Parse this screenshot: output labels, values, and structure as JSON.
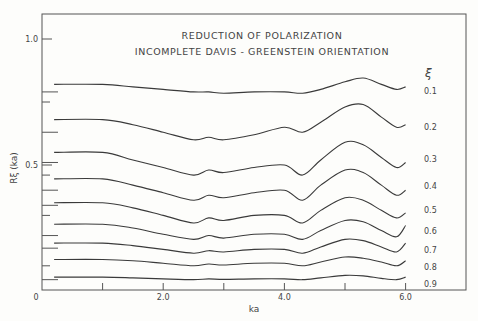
{
  "chart_data": {
    "type": "line",
    "title": "REDUCTION OF POLARIZATION",
    "subtitle": "INCOMPLETE DAVIS - GREENSTEIN ORIENTATION",
    "xlabel": "ka",
    "ylabel": "Rξ (ka)",
    "xlim": [
      0,
      7.0
    ],
    "ylim": [
      0,
      1.2
    ],
    "grid": false,
    "legend_title": "ξ",
    "legend_position": "right, inline labels at curve ends",
    "x_ticks": [
      0,
      1.0,
      2.0,
      3.0,
      4.0,
      5.0,
      6.0
    ],
    "x_tick_labels": [
      "0",
      "2.0",
      "4.0",
      "6.0"
    ],
    "y_tick_labels": [
      "1.0",
      "0.5"
    ],
    "x": [
      0.2,
      1.0,
      1.5,
      2.0,
      2.5,
      2.75,
      3.0,
      3.5,
      4.0,
      4.3,
      4.6,
      5.0,
      5.3,
      5.6,
      5.85,
      6.0
    ],
    "series": [
      {
        "name": "0.1",
        "values": [
          0.82,
          0.82,
          0.81,
          0.8,
          0.79,
          0.79,
          0.785,
          0.79,
          0.79,
          0.785,
          0.8,
          0.83,
          0.845,
          0.82,
          0.8,
          0.81
        ]
      },
      {
        "name": "0.2",
        "values": [
          0.68,
          0.68,
          0.66,
          0.63,
          0.6,
          0.61,
          0.6,
          0.62,
          0.65,
          0.63,
          0.67,
          0.73,
          0.74,
          0.69,
          0.65,
          0.66
        ]
      },
      {
        "name": "0.3",
        "values": [
          0.55,
          0.55,
          0.52,
          0.49,
          0.46,
          0.48,
          0.47,
          0.49,
          0.5,
          0.46,
          0.52,
          0.59,
          0.58,
          0.53,
          0.49,
          0.51
        ]
      },
      {
        "name": "0.4",
        "values": [
          0.445,
          0.445,
          0.42,
          0.39,
          0.36,
          0.38,
          0.37,
          0.39,
          0.4,
          0.36,
          0.42,
          0.48,
          0.47,
          0.42,
          0.38,
          0.4
        ]
      },
      {
        "name": "0.5",
        "values": [
          0.35,
          0.35,
          0.33,
          0.3,
          0.27,
          0.29,
          0.28,
          0.3,
          0.3,
          0.27,
          0.32,
          0.37,
          0.36,
          0.32,
          0.29,
          0.31
        ]
      },
      {
        "name": "0.6",
        "values": [
          0.265,
          0.265,
          0.25,
          0.225,
          0.205,
          0.22,
          0.21,
          0.225,
          0.225,
          0.205,
          0.24,
          0.28,
          0.275,
          0.24,
          0.215,
          0.26
        ]
      },
      {
        "name": "0.7",
        "values": [
          0.19,
          0.19,
          0.18,
          0.165,
          0.15,
          0.16,
          0.155,
          0.165,
          0.165,
          0.15,
          0.175,
          0.205,
          0.2,
          0.175,
          0.155,
          0.19
        ]
      },
      {
        "name": "0.8",
        "values": [
          0.125,
          0.125,
          0.12,
          0.11,
          0.1,
          0.107,
          0.103,
          0.11,
          0.11,
          0.1,
          0.115,
          0.135,
          0.13,
          0.115,
          0.1,
          0.12
        ]
      },
      {
        "name": "0.9",
        "values": [
          0.055,
          0.055,
          0.052,
          0.048,
          0.045,
          0.048,
          0.046,
          0.048,
          0.048,
          0.045,
          0.052,
          0.062,
          0.06,
          0.05,
          0.045,
          0.055
        ]
      }
    ],
    "left_axis_short_marks_y": [
      0.79,
      0.75,
      0.63,
      0.51,
      0.46,
      0.4,
      0.34,
      0.3,
      0.22,
      0.17,
      0.1,
      0.045
    ]
  }
}
